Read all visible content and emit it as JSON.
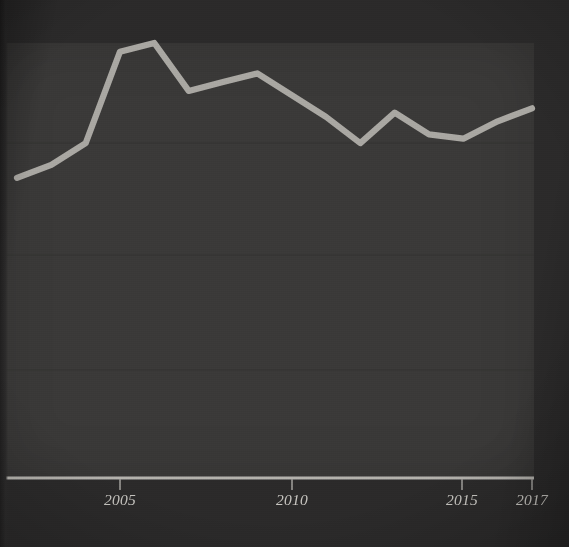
{
  "colors": {
    "page_background": "#2b2a2a",
    "panel_background": "#3a3938",
    "gridline": "#333231",
    "axis": "#b4b2ad",
    "line": "#a9a7a2",
    "tick_label": "#c7c5c0"
  },
  "chart_data": {
    "type": "line",
    "title": "",
    "subtitle": "",
    "xlabel": "",
    "ylabel": "",
    "grid": true,
    "legend": "none",
    "x": [
      2002,
      2003,
      2004,
      2005,
      2006,
      2007,
      2008,
      2009,
      2010,
      2011,
      2012,
      2013,
      2014,
      2015,
      2016,
      2017
    ],
    "xlim": [
      2002,
      2017
    ],
    "ylim": [
      0,
      100
    ],
    "xtick_values": [
      2005,
      2010,
      2015,
      2017
    ],
    "xtick_labels": [
      "2005",
      "2010",
      "2015",
      "2017"
    ],
    "ytick_values": [
      0,
      25,
      50,
      75,
      100
    ],
    "ytick_labels": [],
    "gridline_values": [
      25,
      50,
      75
    ],
    "series": [
      {
        "name": "value",
        "color": "#a9a7a2",
        "values": [
          69,
          72,
          77,
          98,
          100,
          89,
          91,
          93,
          88,
          83,
          77,
          84,
          79,
          78,
          82,
          85
        ]
      }
    ],
    "annotations": []
  },
  "axis": {
    "x_axis_label_2005": "2005",
    "x_axis_label_2010": "2010",
    "x_axis_label_2015": "2015",
    "x_axis_label_2017": "2017"
  }
}
